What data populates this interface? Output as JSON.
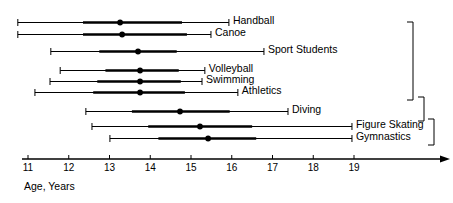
{
  "chart_data": {
    "type": "scatter",
    "title": "",
    "xlabel": "Age, Years",
    "ylabel": "",
    "xlim": [
      10.6,
      21.0
    ],
    "grid": false,
    "legend": null,
    "xticks": [
      11,
      12,
      13,
      14,
      15,
      16,
      17,
      18,
      19
    ],
    "xticklabels": [
      "11",
      "12",
      "13",
      "14",
      "15",
      "16",
      "17",
      "18",
      "19"
    ],
    "annotations": {
      "brackets": [
        {
          "name": "bracket-outer",
          "from_group": "Handball",
          "to_group": "Athletics",
          "label": ""
        },
        {
          "name": "bracket-middle",
          "from_group": "Athletics",
          "to_group": "Diving",
          "label": ""
        },
        {
          "name": "bracket-inner",
          "from_group": "Diving",
          "to_group": "Gymnastics",
          "label": ""
        }
      ]
    },
    "series": [
      {
        "name": "Handball",
        "label": "Handball",
        "median": 13.26,
        "box_low": 12.35,
        "box_high": 14.78,
        "whisker_low": 10.75,
        "whisker_high": 15.93
      },
      {
        "name": "Canoe",
        "label": "Canoe",
        "median": 13.31,
        "box_low": 12.35,
        "box_high": 14.9,
        "whisker_low": 10.75,
        "whisker_high": 15.49
      },
      {
        "name": "Sport Students",
        "label": "Sport Students",
        "median": 13.7,
        "box_low": 12.75,
        "box_high": 14.65,
        "whisker_low": 11.56,
        "whisker_high": 16.79
      },
      {
        "name": "Volleyball",
        "label": "Volleyball",
        "median": 13.75,
        "box_low": 12.9,
        "box_high": 14.7,
        "whisker_low": 11.79,
        "whisker_high": 15.34
      },
      {
        "name": "Swimming",
        "label": "Swimming",
        "median": 13.75,
        "box_low": 12.7,
        "box_high": 14.75,
        "whisker_low": 11.54,
        "whisker_high": 15.27
      },
      {
        "name": "Athletics",
        "label": "Athletics",
        "median": 13.75,
        "box_low": 12.6,
        "box_high": 14.85,
        "whisker_low": 11.17,
        "whisker_high": 16.15
      },
      {
        "name": "Diving",
        "label": "Diving",
        "median": 14.73,
        "box_low": 13.55,
        "box_high": 15.95,
        "whisker_low": 12.42,
        "whisker_high": 17.38
      },
      {
        "name": "Figure Skating",
        "label": "Figure Skating",
        "median": 15.22,
        "box_low": 13.95,
        "box_high": 16.5,
        "whisker_low": 12.57,
        "whisker_high": 18.95
      },
      {
        "name": "Gymnastics",
        "label": "Gymnastics",
        "median": 15.42,
        "box_low": 14.2,
        "box_high": 16.6,
        "whisker_low": 13.01,
        "whisker_high": 18.95
      }
    ]
  },
  "colors": {
    "ink": "#000000",
    "background": "#ffffff"
  },
  "axis": {
    "title": "Age, Years",
    "arrow": "right-arrow-icon"
  }
}
